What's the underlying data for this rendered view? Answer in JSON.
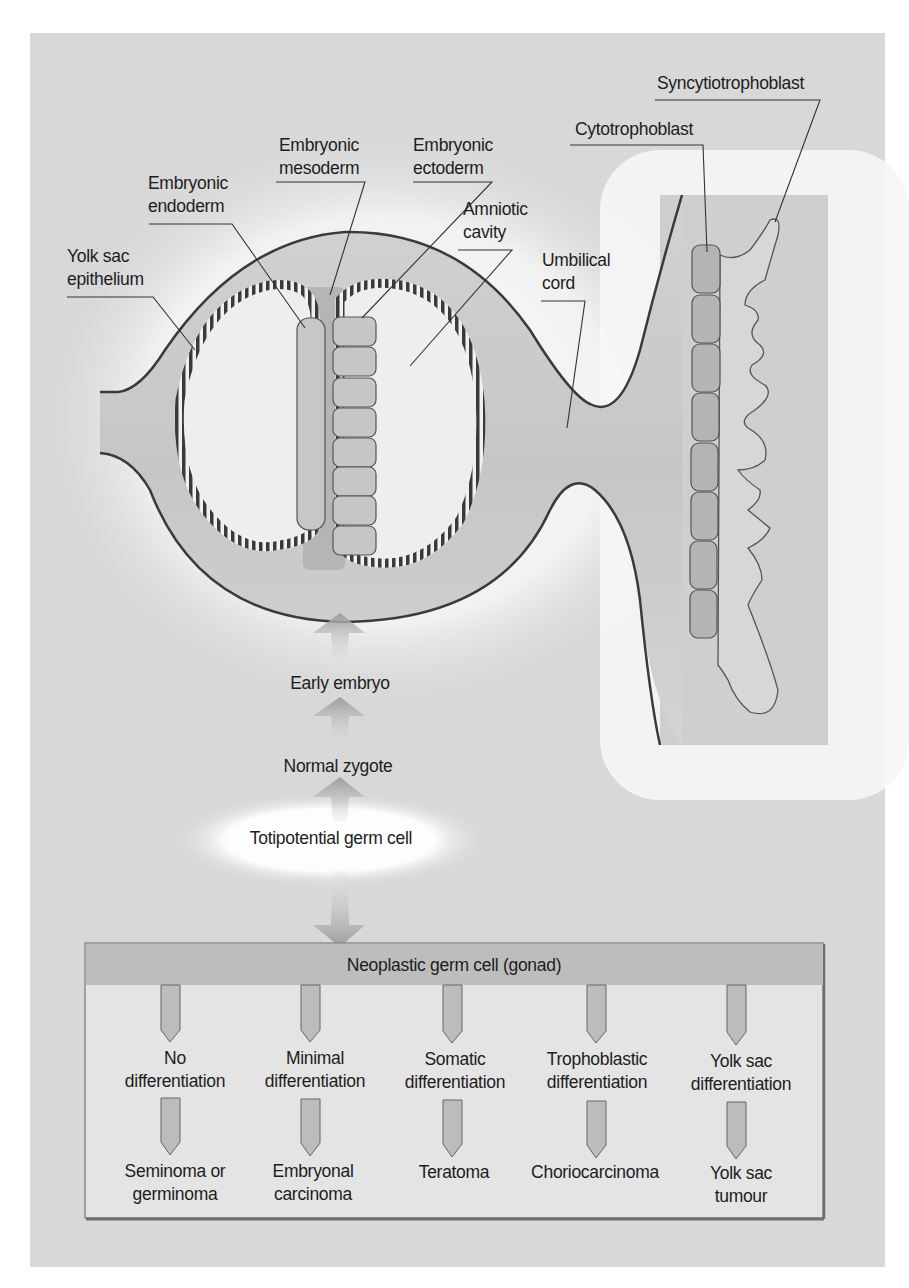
{
  "figure": {
    "colors": {
      "background": "#ffffff",
      "panel": "#d9d9d9",
      "glow": "#f7f7f7",
      "tissue": "#cdcdcd",
      "tissue_dark": "#bdbdbd",
      "outline": "#3a3a3a",
      "cell_fill": "#bcbcbc",
      "arrow": "#a4a4a4",
      "box_fill": "#e6e6e6",
      "box_header": "#bfbfbf",
      "box_border": "#8a8a8a"
    },
    "embryo_labels": {
      "yolk_sac_epithelium": [
        "Yolk sac",
        "epithelium"
      ],
      "embryonic_endoderm": [
        "Embryonic",
        "endoderm"
      ],
      "embryonic_mesoderm": [
        "Embryonic",
        "mesoderm"
      ],
      "embryonic_ectoderm": [
        "Embryonic",
        "ectoderm"
      ],
      "amniotic_cavity": [
        "Amniotic",
        "cavity"
      ],
      "umbilical_cord": [
        "Umbilical",
        "cord"
      ],
      "cytotrophoblast": "Cytotrophoblast",
      "syncytiotrophoblast": "Syncytiotrophoblast"
    },
    "flow": {
      "early_embryo": "Early embryo",
      "normal_zygote": "Normal zygote",
      "totipotential_germ_cell": "Totipotential germ cell"
    },
    "neoplastic_box": {
      "title": "Neoplastic germ cell (gonad)",
      "columns": [
        {
          "differentiation": [
            "No",
            "differentiation"
          ],
          "tumour": [
            "Seminoma or",
            "germinoma"
          ]
        },
        {
          "differentiation": [
            "Minimal",
            "differentiation"
          ],
          "tumour": [
            "Embryonal",
            "carcinoma"
          ]
        },
        {
          "differentiation": [
            "Somatic",
            "differentiation"
          ],
          "tumour": [
            "Teratoma"
          ]
        },
        {
          "differentiation": [
            "Trophoblastic",
            "differentiation"
          ],
          "tumour": [
            "Choriocarcinoma"
          ]
        },
        {
          "differentiation": [
            "Yolk sac",
            "differentiation"
          ],
          "tumour": [
            "Yolk sac",
            "tumour"
          ]
        }
      ]
    }
  }
}
